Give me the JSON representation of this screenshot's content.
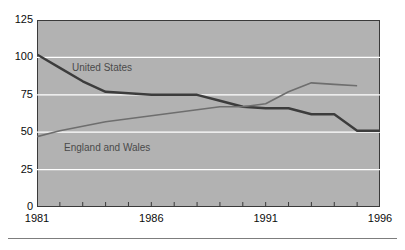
{
  "chart_data": {
    "type": "line",
    "title": "",
    "subtitle": "",
    "xlabel": "",
    "ylabel": "",
    "xlim": [
      1981,
      1996
    ],
    "ylim": [
      0,
      125
    ],
    "grid": true,
    "grid_color": "#ffffff",
    "plot_background": "#b2b2b2",
    "legend": "inline-labels",
    "x_tick_labels": [
      "1981",
      "1986",
      "1991",
      "1996"
    ],
    "x_tick_values": [
      1981,
      1986,
      1991,
      1996
    ],
    "x_minor_ticks": [
      1982,
      1983,
      1984,
      1985,
      1986,
      1987,
      1988,
      1989,
      1990,
      1991,
      1992,
      1993,
      1994,
      1995
    ],
    "y_tick_labels": [
      "0",
      "25",
      "50",
      "75",
      "100",
      "125"
    ],
    "y_tick_values": [
      0,
      25,
      50,
      75,
      100,
      125
    ],
    "series": [
      {
        "name": "United States",
        "color": "#3c3c3c",
        "width": 2.4,
        "x": [
          1981,
          1982,
          1983,
          1984,
          1985,
          1986,
          1987,
          1988,
          1989,
          1990,
          1991,
          1992,
          1993,
          1994,
          1995,
          1996
        ],
        "values": [
          102,
          93,
          84,
          77,
          76,
          75,
          75,
          75,
          71,
          67,
          66,
          66,
          62,
          62,
          51,
          51
        ]
      },
      {
        "name": "England and Wales",
        "color": "#6e6e6e",
        "width": 1.6,
        "x": [
          1981,
          1982,
          1983,
          1984,
          1985,
          1986,
          1987,
          1988,
          1989,
          1990,
          1991,
          1992,
          1993,
          1994,
          1995
        ],
        "values": [
          47,
          51,
          54,
          57,
          59,
          61,
          63,
          65,
          67,
          67,
          69,
          77,
          83,
          82,
          81
        ]
      }
    ],
    "annotations": [
      {
        "text": "United States",
        "x": 1982.6,
        "y": 92
      },
      {
        "text": "England and Wales",
        "x": 1982.2,
        "y": 56
      }
    ]
  },
  "axis": {
    "y_labels": [
      "125",
      "100",
      "75",
      "50",
      "25",
      "0"
    ],
    "x_labels": [
      "1981",
      "1986",
      "1991",
      "1996"
    ]
  },
  "labels": {
    "united_states": "United States",
    "england_and_wales": "England and Wales"
  }
}
